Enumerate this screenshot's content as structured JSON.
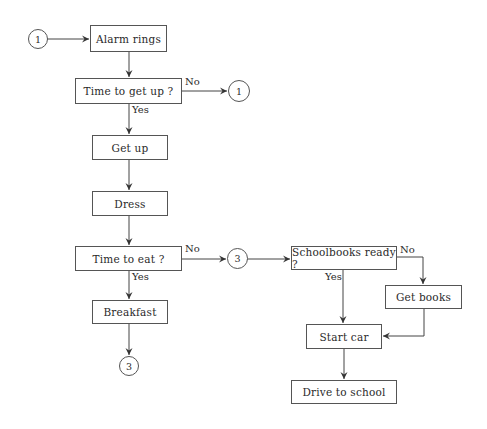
{
  "diagram": {
    "type": "flowchart",
    "nodes": {
      "start_connector": {
        "label": "1"
      },
      "alarm": {
        "label": "Alarm rings"
      },
      "q_getup": {
        "label": "Time to get up ?"
      },
      "loop_connector": {
        "label": "1"
      },
      "getup": {
        "label": "Get up"
      },
      "dress": {
        "label": "Dress"
      },
      "q_eat": {
        "label": "Time to eat ?"
      },
      "eat_no_connector": {
        "label": "3"
      },
      "breakfast": {
        "label": "Breakfast"
      },
      "breakfast_connector": {
        "label": "3"
      },
      "q_books": {
        "label": "Schoolbooks ready ?"
      },
      "getbooks": {
        "label": "Get books"
      },
      "startcar": {
        "label": "Start car"
      },
      "drive": {
        "label": "Drive to school"
      }
    },
    "edge_labels": {
      "getup_no": "No",
      "getup_yes": "Yes",
      "eat_no": "No",
      "eat_yes": "Yes",
      "books_no": "No",
      "books_yes": "Yes"
    },
    "edges": [
      {
        "from": "start_connector",
        "to": "alarm"
      },
      {
        "from": "alarm",
        "to": "q_getup"
      },
      {
        "from": "q_getup",
        "to": "loop_connector",
        "label": "No"
      },
      {
        "from": "q_getup",
        "to": "getup",
        "label": "Yes"
      },
      {
        "from": "getup",
        "to": "dress"
      },
      {
        "from": "dress",
        "to": "q_eat"
      },
      {
        "from": "q_eat",
        "to": "eat_no_connector",
        "label": "No"
      },
      {
        "from": "q_eat",
        "to": "breakfast",
        "label": "Yes"
      },
      {
        "from": "breakfast",
        "to": "breakfast_connector"
      },
      {
        "from": "eat_no_connector",
        "to": "q_books"
      },
      {
        "from": "q_books",
        "to": "getbooks",
        "label": "No"
      },
      {
        "from": "q_books",
        "to": "startcar",
        "label": "Yes"
      },
      {
        "from": "getbooks",
        "to": "startcar"
      },
      {
        "from": "startcar",
        "to": "drive"
      }
    ]
  }
}
